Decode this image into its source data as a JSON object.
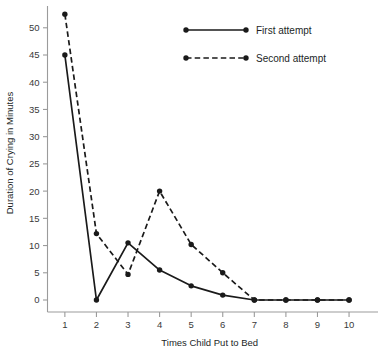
{
  "chart_data": {
    "type": "line",
    "title": "",
    "xlabel": "Times Child Put to Bed",
    "ylabel": "Duration of Crying in Minutes",
    "x": [
      1,
      2,
      3,
      4,
      5,
      6,
      7,
      8,
      9,
      10
    ],
    "xticklabels": [
      "1",
      "2",
      "3",
      "4",
      "5",
      "6",
      "7",
      "8",
      "9",
      "10"
    ],
    "yticks": [
      0,
      5,
      10,
      15,
      20,
      25,
      30,
      35,
      40,
      45,
      50
    ],
    "yticklabels": [
      "0",
      "5",
      "10",
      "15",
      "20",
      "25",
      "30",
      "35",
      "40",
      "45",
      "50"
    ],
    "xlim": [
      0.45,
      10.6
    ],
    "ylim": [
      0,
      54
    ],
    "grid": false,
    "legend_position": "top-center",
    "series": [
      {
        "name": "First attempt",
        "style": "solid",
        "color": "#1a1a1a",
        "values": [
          45,
          0,
          10.5,
          5.5,
          2.6,
          0.9,
          0,
          0,
          0,
          0
        ]
      },
      {
        "name": "Second attempt",
        "style": "dashed",
        "color": "#1a1a1a",
        "values": [
          52.5,
          12.2,
          4.7,
          20,
          10.2,
          5,
          0,
          0,
          0,
          0
        ]
      }
    ]
  },
  "legend": {
    "items": [
      {
        "label": "First attempt",
        "style": "solid"
      },
      {
        "label": "Second attempt",
        "style": "dashed"
      }
    ]
  },
  "axes": {
    "x_title": "Times Child Put to Bed",
    "y_title": "Duration of Crying in Minutes"
  }
}
